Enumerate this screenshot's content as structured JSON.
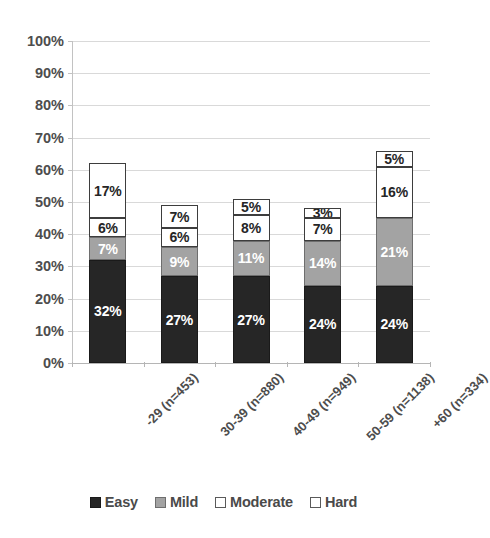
{
  "chart_data": {
    "type": "bar",
    "subtype": "stacked-bar",
    "title": "",
    "subtitle": "",
    "xlabel": "",
    "ylabel": "",
    "ylim": [
      0,
      100
    ],
    "y_tick_step": 10,
    "y_tick_labels": [
      "0%",
      "10%",
      "20%",
      "30%",
      "40%",
      "50%",
      "60%",
      "70%",
      "80%",
      "90%",
      "100%"
    ],
    "grid": true,
    "grid_axis": "y",
    "legend_position": "bottom",
    "value_label_suffix": "%",
    "categories": [
      "-29 (n=453)",
      "30-39 (n=880)",
      "40-49 (n=949)",
      "50-59 (n=1138)",
      "+60 (n=334)"
    ],
    "series": [
      {
        "name": "Easy",
        "color": "#262626",
        "values": [
          32,
          27,
          27,
          24,
          24
        ],
        "labels": [
          "32%",
          "27%",
          "27%",
          "24%",
          "24%"
        ]
      },
      {
        "name": "Mild",
        "color": "#a3a3a3",
        "values": [
          7,
          9,
          11,
          14,
          21
        ],
        "labels": [
          "7%",
          "9%",
          "11%",
          "14%",
          "21%"
        ]
      },
      {
        "name": "Moderate",
        "color": "#ffffff",
        "values": [
          6,
          6,
          8,
          7,
          16
        ],
        "labels": [
          "6%",
          "6%",
          "8%",
          "7%",
          "16%"
        ]
      },
      {
        "name": "Hard",
        "color": "#ffffff",
        "values": [
          17,
          7,
          5,
          3,
          5
        ],
        "labels": [
          "17%",
          "7%",
          "5%",
          "3%",
          "5%"
        ]
      }
    ],
    "totals": [
      62,
      49,
      51,
      48,
      66
    ]
  },
  "legend": {
    "items": [
      {
        "label": "Easy",
        "swatch": "easy"
      },
      {
        "label": "Mild",
        "swatch": "mild"
      },
      {
        "label": "Moderate",
        "swatch": "moderate"
      },
      {
        "label": "Hard",
        "swatch": "hard"
      }
    ]
  }
}
